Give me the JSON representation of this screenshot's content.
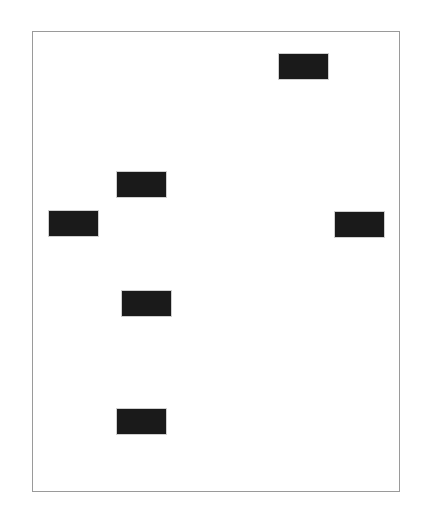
{
  "canvas": {
    "width": 434,
    "height": 513,
    "background": "#ffffff",
    "frame_border_color": "#9a9a9a"
  },
  "blocks": [
    {
      "id": "block-1",
      "x": 279,
      "y": 54,
      "label": "",
      "redacted": true,
      "fill": "#1a1a1a"
    },
    {
      "id": "block-2",
      "x": 117,
      "y": 172,
      "label": "",
      "redacted": true,
      "fill": "#1a1a1a"
    },
    {
      "id": "block-3",
      "x": 49,
      "y": 211,
      "label": "",
      "redacted": true,
      "fill": "#1a1a1a"
    },
    {
      "id": "block-4",
      "x": 335,
      "y": 212,
      "label": "",
      "redacted": true,
      "fill": "#1a1a1a"
    },
    {
      "id": "block-5",
      "x": 122,
      "y": 291,
      "label": "",
      "redacted": true,
      "fill": "#1a1a1a"
    },
    {
      "id": "block-6",
      "x": 117,
      "y": 409,
      "label": "",
      "redacted": true,
      "fill": "#1a1a1a"
    }
  ]
}
